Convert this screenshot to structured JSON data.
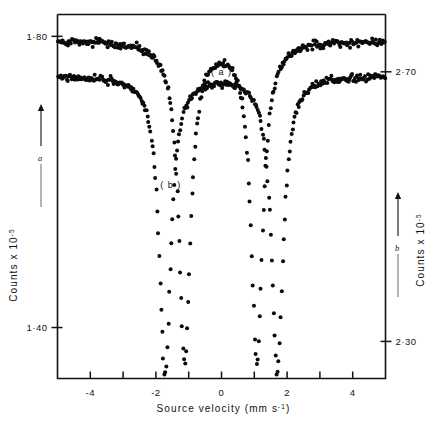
{
  "figure": {
    "name": "mossbauer-spectrum-figure",
    "background": "#ffffff",
    "ink_color": "#0b0b0b"
  },
  "chart_data": {
    "type": "scatter",
    "title": "",
    "subtitle": "",
    "xlabel": "Source velocity (mm s-1)",
    "xlabel_main": "Source velocity",
    "xlabel_unit_open": "(mm s",
    "xlabel_unit_sup": "-1",
    "xlabel_unit_close": ")",
    "ylabel_left": "Counts x 10",
    "ylabel_left_sup": "-5",
    "ylabel_right": "Counts x 10",
    "ylabel_right_sup": "-5",
    "xlim": [
      -5.0,
      5.0
    ],
    "xticks": [
      -4,
      -3,
      -2,
      -1,
      0,
      1,
      2,
      3,
      4
    ],
    "xticklabels": [
      "-4",
      "",
      "-2",
      "",
      "0",
      "",
      "2",
      "",
      "4"
    ],
    "grid": false,
    "legend": "none",
    "left_axis": {
      "ticks": [
        1.8,
        1.4
      ],
      "ticklabels": [
        "1·80",
        "1·40"
      ],
      "ylim": [
        1.33,
        1.83
      ],
      "applies_to": "a"
    },
    "right_axis": {
      "ticks": [
        2.7,
        2.3
      ],
      "ticklabels": [
        "2·70",
        "2·30"
      ],
      "ylim": [
        2.245,
        2.785
      ],
      "applies_to": "b"
    },
    "annotations": [
      {
        "name": "curve-a-label",
        "text": "( a )",
        "x": 0.0,
        "y_px": 75
      },
      {
        "name": "curve-b-label",
        "text": "( b )",
        "x": -1.55,
        "y_px": 188
      },
      {
        "name": "left-axis-marker-letter",
        "text": "a"
      },
      {
        "name": "right-axis-marker-letter",
        "text": "b"
      }
    ],
    "series": [
      {
        "name": "a",
        "label": "( a )",
        "axis": "left",
        "baseline": 1.795,
        "marker": "filled-circle",
        "marker_size_px": 2.0,
        "noise": 0.006,
        "lines": [
          {
            "center": -4.95,
            "depth": 0.0,
            "width": 0.22
          },
          {
            "center": -1.12,
            "depth": 0.44,
            "width": 0.215
          },
          {
            "center": 1.08,
            "depth": 0.44,
            "width": 0.215
          }
        ],
        "description": "Upper spectrum, broad flat baseline near 1.80 with two very deep inner absorption lines near -1.1 and +1.1 mm/s"
      },
      {
        "name": "b",
        "label": "( b )",
        "axis": "right",
        "baseline": 2.695,
        "marker": "filled-circle",
        "marker_size_px": 2.0,
        "noise": 0.006,
        "lines": [
          {
            "center": -1.72,
            "depth": 0.44,
            "width": 0.215
          },
          {
            "center": 1.7,
            "depth": 0.44,
            "width": 0.215
          }
        ],
        "description": "Lower spectrum, baseline near 2.70 with two deep outer absorption lines near -1.7 and +1.7 mm/s"
      }
    ]
  }
}
